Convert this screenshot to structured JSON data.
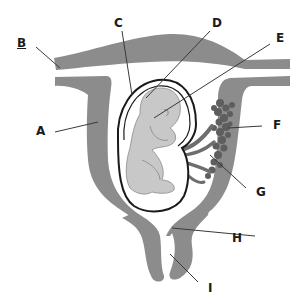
{
  "diagram": {
    "colors": {
      "tissue": "#8c8c8c",
      "tissue_dark": "#6e6e6e",
      "fetus": "#c8c8c8",
      "outline": "#1a1a1a",
      "leader_line": "#3a3a3a",
      "background": "#ffffff"
    },
    "labels": [
      {
        "id": "A",
        "text": "A"
      },
      {
        "id": "B",
        "text": "B"
      },
      {
        "id": "C",
        "text": "C"
      },
      {
        "id": "D",
        "text": "D"
      },
      {
        "id": "E",
        "text": "E"
      },
      {
        "id": "F",
        "text": "F"
      },
      {
        "id": "G",
        "text": "G"
      },
      {
        "id": "H",
        "text": "H"
      },
      {
        "id": "I",
        "text": "I"
      }
    ]
  }
}
